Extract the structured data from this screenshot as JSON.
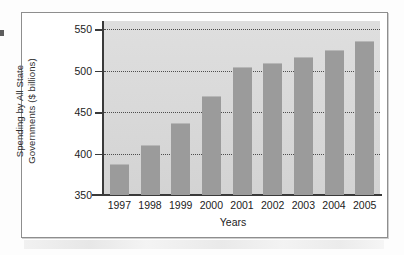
{
  "chart_data": {
    "type": "bar",
    "title": "",
    "xlabel": "Years",
    "ylabel": "Spending by All State Governments ($ billions)",
    "ylabel_line1": "Spending by All State",
    "ylabel_line2": "Governments ($ billions)",
    "categories": [
      "1997",
      "1998",
      "1999",
      "2000",
      "2001",
      "2002",
      "2003",
      "2004",
      "2005"
    ],
    "values": [
      388,
      410,
      437,
      469,
      505,
      509,
      517,
      525,
      536
    ],
    "ylim": [
      350,
      560
    ],
    "yticks": [
      350,
      400,
      450,
      500,
      550
    ],
    "ytick_labels": [
      "350",
      "400",
      "450",
      "500",
      "550"
    ],
    "grid": true,
    "grid_axis": "y",
    "grid_style": "dotted",
    "legend": false,
    "bar_color": "#9b9b9b",
    "plot_background": "#dadada",
    "axis_color": "#3a3a3a",
    "frame_color": "#8e8e8e"
  }
}
